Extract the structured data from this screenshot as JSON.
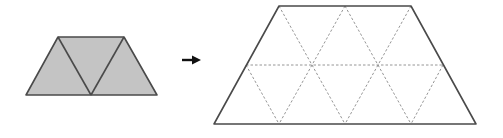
{
  "diagram": {
    "colors": {
      "fill": "#c4c4c4",
      "outline": "#4a4a4a",
      "dashed": "#8a8a8a",
      "arrow": "#111111",
      "background": "#ffffff"
    },
    "small_trapezoid": {
      "triangle_count": 3,
      "shaded": true
    },
    "arrow": {
      "direction": "right"
    },
    "large_trapezoid": {
      "triangle_count": 12,
      "shaded": false,
      "internal_lines": "dashed"
    }
  }
}
